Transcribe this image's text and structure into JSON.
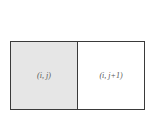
{
  "diagram": {
    "cells": [
      {
        "label": "(i, j)",
        "fill": "#e6e6e6"
      },
      {
        "label": "(i, j+1)",
        "fill": "#ffffff"
      }
    ],
    "border_color": "#3a3a3a"
  }
}
